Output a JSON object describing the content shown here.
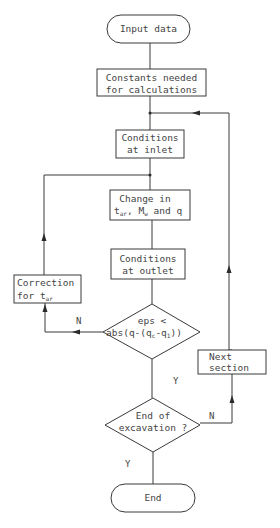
{
  "flowchart": {
    "nodes": {
      "start": {
        "type": "terminator",
        "lines": [
          "Input data"
        ]
      },
      "constants": {
        "type": "process",
        "lines": [
          "Constants needed",
          "for calculations"
        ]
      },
      "inlet": {
        "type": "process",
        "lines": [
          "Conditions",
          "at inlet"
        ]
      },
      "change": {
        "type": "process",
        "line1": "Change in",
        "line2": {
          "t": "t",
          "t_sub": "ar",
          "sep": ", ",
          "m": "M",
          "m_sub": "w",
          "rest": " and q"
        }
      },
      "outlet": {
        "type": "process",
        "lines": [
          "Conditions",
          "at outlet"
        ]
      },
      "correction": {
        "type": "process",
        "line1": "Correction",
        "line2": {
          "text": "for t",
          "sub": "ar"
        }
      },
      "decision1": {
        "type": "decision",
        "line1": "eps <",
        "line2": {
          "a": "abs(q-(q",
          "sub1": "c",
          "b": "-q",
          "sub2": "1",
          "c": "))"
        }
      },
      "next": {
        "type": "process",
        "lines": [
          "Next",
          "section"
        ]
      },
      "decision2": {
        "type": "decision",
        "lines": [
          "End of",
          "excavation ?"
        ]
      },
      "end": {
        "type": "terminator",
        "lines": [
          "End"
        ]
      }
    },
    "edge_labels": {
      "d1_no": "N",
      "d1_yes": "Y",
      "d2_no": "N",
      "d2_yes": "Y"
    }
  }
}
